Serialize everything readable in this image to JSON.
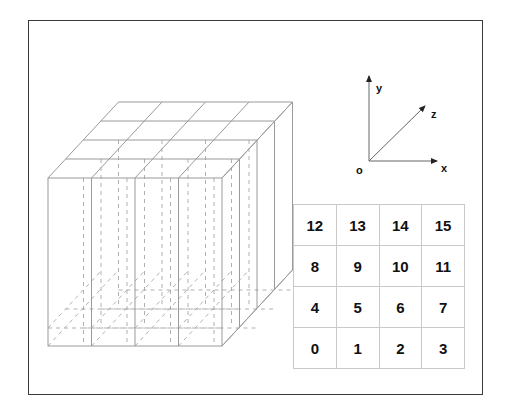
{
  "figure": {
    "border_color": "#3a3a3a",
    "background_color": "#ffffff"
  },
  "axes": {
    "origin_label": "o",
    "x_label": "x",
    "y_label": "y",
    "z_label": "z",
    "line_color": "#555555"
  },
  "cube": {
    "divisions_x": 4,
    "divisions_y": 4,
    "divisions_z": 4,
    "visible_edge_color": "#9a9a9a",
    "hidden_edge_color": "#a8a8a8",
    "projection": "oblique"
  },
  "grid": {
    "columns": 4,
    "rows": 4,
    "line_color": "#c9c9c9",
    "text_color": "#111111",
    "cells": [
      [
        "12",
        "13",
        "14",
        "15"
      ],
      [
        "8",
        "9",
        "10",
        "11"
      ],
      [
        "4",
        "5",
        "6",
        "7"
      ],
      [
        "0",
        "1",
        "2",
        "3"
      ]
    ]
  }
}
